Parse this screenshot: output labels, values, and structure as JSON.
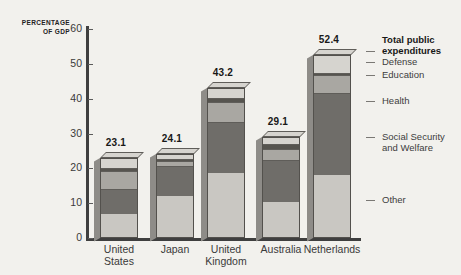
{
  "chart_data": {
    "type": "bar",
    "subtype": "stacked-bar-3d",
    "title": "",
    "xlabel": "",
    "ylabel": "PERCENTAGE OF GDP",
    "ylabel_line1": "PERCENTAGE",
    "ylabel_line2": "OF GDP",
    "ylim": [
      0,
      60
    ],
    "yticks": [
      0,
      10,
      20,
      30,
      40,
      50,
      60
    ],
    "ytick_labels": [
      "0",
      "10",
      "20",
      "30",
      "40",
      "50",
      "60"
    ],
    "grid": false,
    "legend_position": "right",
    "categories": [
      "United States",
      "Japan",
      "United Kingdom",
      "Australia",
      "Netherlands"
    ],
    "category_lines": [
      [
        "United",
        "States"
      ],
      [
        "Japan",
        ""
      ],
      [
        "United",
        "Kingdom"
      ],
      [
        "Australia",
        ""
      ],
      [
        "Netherlands",
        ""
      ]
    ],
    "totals": [
      23.1,
      24.1,
      43.2,
      29.1,
      52.4
    ],
    "total_labels": [
      "23.1",
      "24.1",
      "43.2",
      "29.1",
      "52.4"
    ],
    "series": [
      {
        "name": "Other",
        "color": "#c9c7c2",
        "values": [
          7.0,
          12.2,
          18.6,
          10.3,
          18.2
        ]
      },
      {
        "name": "Social Security and Welfare",
        "color": "#6f6d69",
        "values": [
          7.0,
          8.4,
          14.8,
          12.0,
          23.4
        ]
      },
      {
        "name": "Health",
        "color": "#a9a7a2",
        "values": [
          5.1,
          1.5,
          5.7,
          3.2,
          5.2
        ]
      },
      {
        "name": "Education",
        "color": "#56544f",
        "values": [
          1.0,
          0.7,
          1.1,
          1.6,
          0.6
        ]
      },
      {
        "name": "Defense",
        "color": "#d6d4cf",
        "values": [
          3.0,
          1.3,
          3.0,
          2.0,
          5.0
        ]
      }
    ],
    "legend_entries": [
      {
        "label": "Total public",
        "label2": "expenditures",
        "kind": "title"
      },
      {
        "label": "Defense",
        "kind": "item"
      },
      {
        "label": "Education",
        "kind": "item"
      },
      {
        "label": "Health",
        "kind": "item"
      },
      {
        "label": "Social Security",
        "label2": "and Welfare",
        "kind": "item"
      },
      {
        "label": "Other",
        "kind": "item"
      }
    ]
  },
  "legend": {
    "title_line1": "Total public",
    "title_line2": "expenditures",
    "defense": "Defense",
    "education": "Education",
    "health": "Health",
    "social_line1": "Social Security",
    "social_line2": "and Welfare",
    "other": "Other"
  },
  "axis": {
    "title_line1": "PERCENTAGE",
    "title_line2": "OF GDP"
  },
  "colors": {
    "background": "#f2f1ed",
    "axis": "#3f3f3f",
    "other": "#c9c7c2",
    "social": "#6f6d69",
    "health": "#a9a7a2",
    "education": "#56544f",
    "defense": "#d6d4cf"
  }
}
